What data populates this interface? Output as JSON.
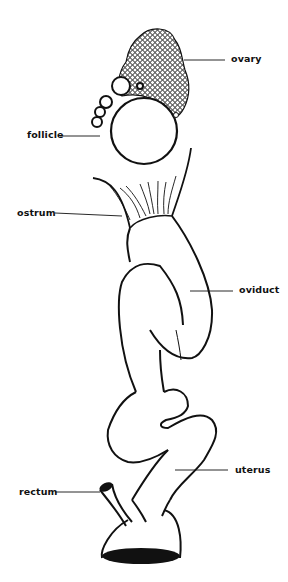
{
  "diagram": {
    "type": "anatomical-illustration",
    "stroke_color": "#111111",
    "background": "#ffffff",
    "labels": [
      {
        "id": "ovary",
        "text": "ovary"
      },
      {
        "id": "follicle",
        "text": "follicle"
      },
      {
        "id": "ostrum",
        "text": "ostrum"
      },
      {
        "id": "oviduct",
        "text": "oviduct"
      },
      {
        "id": "uterus",
        "text": "uterus"
      },
      {
        "id": "rectum",
        "text": "rectum"
      }
    ]
  }
}
